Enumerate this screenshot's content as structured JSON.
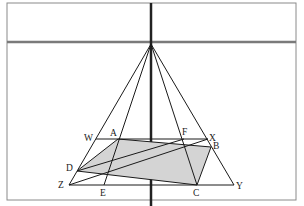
{
  "diagram": {
    "type": "perspective-geometry",
    "apex": {
      "x": 151,
      "y": 44
    },
    "points": {
      "W": {
        "x": 96,
        "y": 139,
        "label": "W",
        "lx": 84,
        "ly": 140
      },
      "A": {
        "x": 118,
        "y": 139,
        "label": "A",
        "lx": 111,
        "ly": 136
      },
      "F": {
        "x": 184,
        "y": 139,
        "label": "F",
        "lx": 183,
        "ly": 135
      },
      "X": {
        "x": 208,
        "y": 139,
        "label": "X",
        "lx": 210,
        "ly": 141
      },
      "B": {
        "x": 211,
        "y": 147,
        "label": "B",
        "lx": 213,
        "ly": 148
      },
      "D": {
        "x": 77,
        "y": 171,
        "label": "D",
        "lx": 66,
        "ly": 170
      },
      "Z": {
        "x": 69,
        "y": 185,
        "label": "Z",
        "lx": 58,
        "ly": 187
      },
      "E": {
        "x": 104,
        "y": 185,
        "label": "E",
        "lx": 100,
        "ly": 196
      },
      "C": {
        "x": 197,
        "y": 185,
        "label": "C",
        "lx": 193,
        "ly": 196
      },
      "Y": {
        "x": 234,
        "y": 185,
        "label": "Y",
        "lx": 236,
        "ly": 188
      }
    },
    "labels": [
      "W",
      "A",
      "F",
      "X",
      "B",
      "D",
      "Z",
      "E",
      "C",
      "Y"
    ],
    "colors": {
      "frame": "#8a8a8a",
      "line": "#1a1a1a",
      "shade": "#d4d4d4",
      "axis": "#222222"
    }
  }
}
